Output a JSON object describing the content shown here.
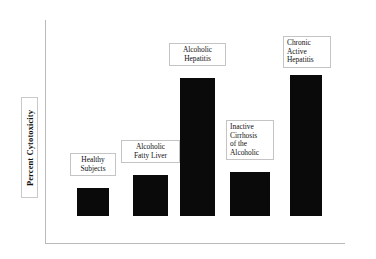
{
  "chart_data": {
    "type": "bar",
    "title": "",
    "subtitle": "",
    "xlabel": "",
    "ylabel": "Percent Cytotoxicity",
    "grid": false,
    "legend": "none",
    "axis_note": "Y axis has no numeric tick labels; bar heights are relative (schematic).",
    "categories": [
      "Healthy Subjects",
      "Alcoholic Fatty Liver",
      "Alcoholic Hepatitis",
      "Inactive Cirrhosis of the Alcoholic",
      "Chronic Active Hepatitis"
    ],
    "values": [
      28,
      41,
      138,
      44,
      141
    ],
    "ylim": [
      0,
      160
    ],
    "bars": [
      {
        "category": "Healthy Subjects",
        "label_lines": [
          "Healthy",
          "Subjects"
        ],
        "align": "center",
        "value": 28,
        "x": 77,
        "width": 32,
        "top": 188,
        "bottom": 216,
        "label_x": 70,
        "label_y": 153,
        "label_w": 46
      },
      {
        "category": "Alcoholic Fatty Liver",
        "label_lines": [
          "Alcoholic",
          "Fatty Liver"
        ],
        "align": "center",
        "value": 41,
        "x": 133,
        "width": 35,
        "top": 175,
        "bottom": 216,
        "label_x": 121,
        "label_y": 140,
        "label_w": 59
      },
      {
        "category": "Alcoholic Hepatitis",
        "label_lines": [
          "Alcoholic",
          "Hepatitis"
        ],
        "align": "center",
        "value": 138,
        "x": 180,
        "width": 35,
        "top": 78,
        "bottom": 216,
        "label_x": 169,
        "label_y": 43,
        "label_w": 57
      },
      {
        "category": "Inactive Cirrhosis of the Alcoholic",
        "label_lines": [
          "Inactive",
          "Cirrhosis",
          "of the",
          "Alcoholic"
        ],
        "align": "left",
        "value": 44,
        "x": 230,
        "width": 40,
        "top": 172,
        "bottom": 216,
        "label_x": 226,
        "label_y": 120,
        "label_w": 48
      },
      {
        "category": "Chronic Active Hepatitis",
        "label_lines": [
          "Chronic",
          "Active",
          "Hepatitis"
        ],
        "align": "left",
        "value": 141,
        "x": 290,
        "width": 32,
        "top": 75,
        "bottom": 216,
        "label_x": 283,
        "label_y": 36,
        "label_w": 48
      }
    ]
  },
  "colors": {
    "bar_fill": "#0a0a0a",
    "axis": "#b9b9b9",
    "label_border": "#c4c4c4",
    "background": "#ffffff",
    "text": "#111111"
  }
}
